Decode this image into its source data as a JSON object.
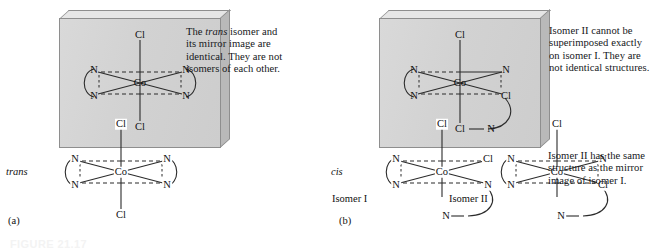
{
  "figure": {
    "caption_id": "FIGURE 21.17",
    "panels": [
      {
        "id": "panel-a",
        "caption": "(a)"
      },
      {
        "id": "panel-b",
        "caption": "(b)"
      }
    ]
  },
  "atoms": {
    "cl": "Cl",
    "n": "N",
    "co": "Co"
  },
  "panel_a": {
    "caption": "(a)",
    "callout": {
      "line1_pre": "The ",
      "line1_em": "trans",
      "line1_post": " isomer and",
      "line2": "its mirror image are",
      "line3": "identical. They are not",
      "line4": "isomers of each other."
    },
    "isomer_label": "trans",
    "boxed_molecule": {
      "name": "trans-dichlorobis(ethylenediamine)cobalt",
      "center": "Co",
      "axial_top": "Cl",
      "axial_bottom": "Cl",
      "equatorial": [
        "N",
        "N",
        "N",
        "N"
      ]
    },
    "mirror_molecule": {
      "name": "trans isomer mirror image",
      "center": "Co",
      "axial_top": "Cl",
      "axial_bottom": "Cl",
      "equatorial": [
        "N",
        "N",
        "N",
        "N"
      ]
    }
  },
  "panel_b": {
    "caption": "(b)",
    "callout_top": {
      "line1": "Isomer II cannot be",
      "line2": "superimposed exactly",
      "line3": "on isomer I. They are",
      "line4": "not identical structures."
    },
    "callout_right": {
      "line1": "Isomer II has the same",
      "line2": "structure as the mirror",
      "line3": "image of isomer I."
    },
    "isomer_label": "cis",
    "isomer_one_label": "Isomer I",
    "isomer_two_label": "Isomer II",
    "boxed_molecule": {
      "name": "cis isomer in mirror plane",
      "center": "Co",
      "axial_top": "Cl",
      "axial_bottom": "N",
      "equatorial": [
        "N",
        "N",
        "N",
        "Cl"
      ],
      "extra_cl": "Cl"
    },
    "isomer_one": {
      "center": "Co",
      "axial_top": "Cl",
      "axial_bottom": "N",
      "equatorial": [
        "N",
        "N",
        "N",
        "Cl"
      ]
    },
    "isomer_two": {
      "center": "Co",
      "axial_top": "Cl",
      "axial_bottom": "N",
      "equatorial": [
        "N",
        "N",
        "N",
        "Cl"
      ]
    }
  },
  "colors": {
    "box_face": "#d4d4d4",
    "box_edge": "#8e8e8e",
    "bond": "#2b2b2b",
    "text": "#15171a"
  }
}
